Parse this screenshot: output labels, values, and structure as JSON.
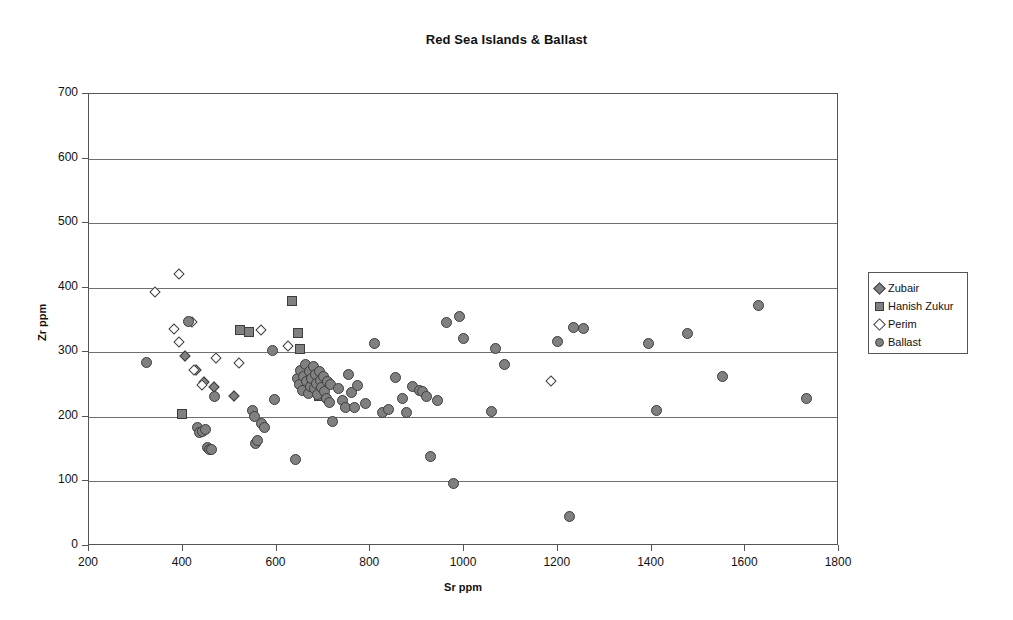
{
  "chart_data": {
    "type": "scatter",
    "title": "Red Sea Islands & Ballast",
    "xlabel": "Sr ppm",
    "ylabel": "Zr ppm",
    "xlim": [
      200,
      1800
    ],
    "ylim": [
      0,
      700
    ],
    "xticks": [
      200,
      400,
      600,
      800,
      1000,
      1200,
      1400,
      1600,
      1800
    ],
    "yticks": [
      0,
      100,
      200,
      300,
      400,
      500,
      600,
      700
    ],
    "grid": "horizontal",
    "legend_position": "right",
    "marker_fill": "#808080",
    "marker_stroke": "#3d3d3d",
    "series": [
      {
        "name": "Zubair",
        "marker": "diamond-filled",
        "points": [
          [
            404,
            295
          ],
          [
            428,
            273
          ],
          [
            446,
            254
          ],
          [
            467,
            247
          ],
          [
            510,
            233
          ]
        ]
      },
      {
        "name": "Hanish Zukur",
        "marker": "square",
        "points": [
          [
            399,
            204
          ],
          [
            522,
            335
          ],
          [
            541,
            332
          ],
          [
            633,
            380
          ],
          [
            645,
            330
          ],
          [
            650,
            305
          ],
          [
            690,
            232
          ]
        ]
      },
      {
        "name": "Perim",
        "marker": "diamond-open",
        "points": [
          [
            340,
            393
          ],
          [
            392,
            422
          ],
          [
            382,
            336
          ],
          [
            392,
            316
          ],
          [
            420,
            347
          ],
          [
            424,
            272
          ],
          [
            440,
            249
          ],
          [
            471,
            291
          ],
          [
            520,
            283
          ],
          [
            567,
            334
          ],
          [
            625,
            309
          ],
          [
            1186,
            255
          ]
        ]
      },
      {
        "name": "Ballast",
        "marker": "circle",
        "points": [
          [
            322,
            284
          ],
          [
            412,
            348
          ],
          [
            432,
            183
          ],
          [
            436,
            176
          ],
          [
            443,
            177
          ],
          [
            449,
            181
          ],
          [
            452,
            152
          ],
          [
            456,
            150
          ],
          [
            462,
            150
          ],
          [
            468,
            232
          ],
          [
            548,
            210
          ],
          [
            553,
            201
          ],
          [
            556,
            158
          ],
          [
            560,
            163
          ],
          [
            569,
            190
          ],
          [
            574,
            184
          ],
          [
            592,
            302
          ],
          [
            596,
            227
          ],
          [
            640,
            134
          ],
          [
            645,
            260
          ],
          [
            648,
            250
          ],
          [
            652,
            272
          ],
          [
            655,
            241
          ],
          [
            658,
            263
          ],
          [
            662,
            281
          ],
          [
            665,
            254
          ],
          [
            668,
            236
          ],
          [
            670,
            271
          ],
          [
            672,
            247
          ],
          [
            675,
            259
          ],
          [
            678,
            278
          ],
          [
            680,
            244
          ],
          [
            683,
            265
          ],
          [
            686,
            252
          ],
          [
            688,
            234
          ],
          [
            691,
            270
          ],
          [
            694,
            257
          ],
          [
            697,
            245
          ],
          [
            700,
            262
          ],
          [
            703,
            240
          ],
          [
            706,
            228
          ],
          [
            709,
            255
          ],
          [
            712,
            222
          ],
          [
            716,
            250
          ],
          [
            720,
            193
          ],
          [
            733,
            244
          ],
          [
            741,
            226
          ],
          [
            748,
            215
          ],
          [
            754,
            266
          ],
          [
            760,
            238
          ],
          [
            766,
            214
          ],
          [
            772,
            249
          ],
          [
            790,
            220
          ],
          [
            808,
            313
          ],
          [
            826,
            206
          ],
          [
            838,
            211
          ],
          [
            854,
            261
          ],
          [
            868,
            228
          ],
          [
            878,
            206
          ],
          [
            890,
            247
          ],
          [
            906,
            241
          ],
          [
            912,
            240
          ],
          [
            920,
            231
          ],
          [
            928,
            139
          ],
          [
            944,
            226
          ],
          [
            963,
            346
          ],
          [
            978,
            97
          ],
          [
            990,
            356
          ],
          [
            998,
            322
          ],
          [
            1058,
            208
          ],
          [
            1068,
            306
          ],
          [
            1086,
            281
          ],
          [
            1200,
            316
          ],
          [
            1226,
            45
          ],
          [
            1234,
            338
          ],
          [
            1254,
            337
          ],
          [
            1394,
            313
          ],
          [
            1410,
            210
          ],
          [
            1476,
            329
          ],
          [
            1552,
            262
          ],
          [
            1628,
            372
          ],
          [
            1730,
            228
          ]
        ]
      }
    ]
  }
}
